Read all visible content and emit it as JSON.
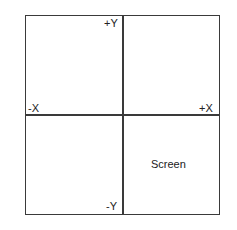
{
  "diagram": {
    "type": "coordinate-quadrants",
    "axes": {
      "positive_y": "+Y",
      "negative_y": "-Y",
      "positive_x": "+X",
      "negative_x": "-X"
    },
    "quadrant_label": "Screen",
    "quadrant_label_position": "bottom-right",
    "line_color": "#3a3a3a",
    "background": "#ffffff"
  }
}
